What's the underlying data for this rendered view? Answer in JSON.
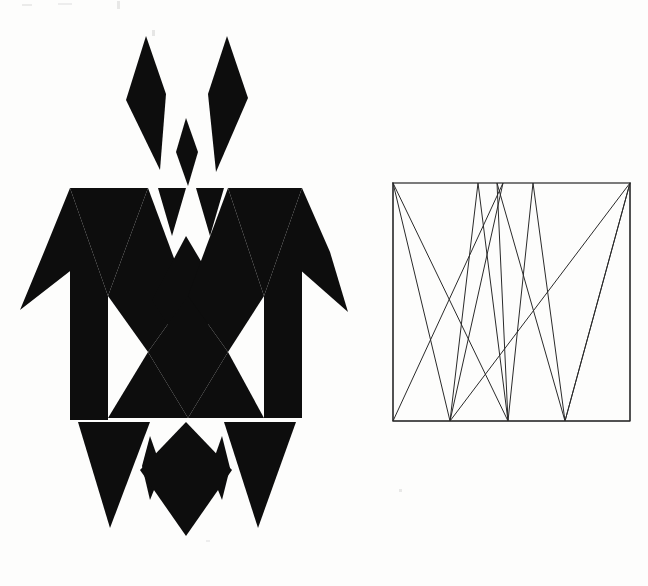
{
  "page": {
    "title": "Geometric turtle motif with companion zigzag line diagram",
    "background_color": "#fdfdfc",
    "ink_color": "#0d0d0d",
    "line_color": "#2a2a2a",
    "width": 648,
    "height": 586
  },
  "figures": [
    {
      "id": "turtle-motif",
      "name": "Geometric turtle motif",
      "description": "Solid black triangle-and-diamond composition forming a turtle seen from above",
      "bounds": {
        "x": 18,
        "y": 36,
        "width": 330,
        "height": 500
      },
      "parts": [
        {
          "name": "head-left-plume",
          "kind": "diamond"
        },
        {
          "name": "head-right-plume",
          "kind": "diamond"
        },
        {
          "name": "head-center-spike",
          "kind": "diamond"
        },
        {
          "name": "front-left-flipper",
          "kind": "triangle"
        },
        {
          "name": "front-right-flipper",
          "kind": "triangle"
        },
        {
          "name": "shell-zigzag-band-upper",
          "kind": "chevron-band"
        },
        {
          "name": "shell-zigzag-band-middle",
          "kind": "chevron-band"
        },
        {
          "name": "shell-zigzag-band-lower",
          "kind": "chevron-band"
        },
        {
          "name": "hind-left-leg",
          "kind": "triangle"
        },
        {
          "name": "hind-right-leg",
          "kind": "triangle"
        },
        {
          "name": "tail-diamond",
          "kind": "diamond"
        }
      ]
    },
    {
      "id": "zigzag-diagram",
      "name": "Square zigzag line diagram",
      "description": "Open square frame crossed by a continuous zigzag polyline running between top and bottom edges",
      "bounds": {
        "x": 393,
        "y": 183,
        "width": 237,
        "height": 238
      },
      "frame": {
        "left": 393,
        "top": 183,
        "right": 630,
        "bottom": 421
      }
    }
  ],
  "chart_data": {
    "type": "line",
    "xlabel": "",
    "ylabel": "",
    "xlim": [
      393,
      630
    ],
    "ylim": [
      183,
      421
    ],
    "grid": false,
    "legend": false,
    "frame": {
      "left": 393,
      "top": 183,
      "right": 630,
      "bottom": 421
    },
    "top_vertices_x": [
      393,
      478,
      497,
      503,
      533,
      630
    ],
    "bottom_vertices_x": [
      393,
      450,
      508,
      565,
      630
    ],
    "series": [
      {
        "name": "zigzag-path-a",
        "points": [
          [
            393,
            183
          ],
          [
            450,
            421
          ],
          [
            478,
            183
          ],
          [
            508,
            421
          ],
          [
            533,
            183
          ],
          [
            565,
            421
          ],
          [
            630,
            183
          ]
        ]
      },
      {
        "name": "zigzag-path-b",
        "points": [
          [
            393,
            183
          ],
          [
            508,
            421
          ],
          [
            497,
            183
          ],
          [
            565,
            421
          ],
          [
            630,
            183
          ]
        ]
      },
      {
        "name": "zigzag-path-c",
        "points": [
          [
            393,
            183
          ],
          [
            393,
            421
          ],
          [
            503,
            183
          ],
          [
            450,
            421
          ],
          [
            630,
            183
          ],
          [
            630,
            421
          ],
          [
            393,
            421
          ]
        ]
      }
    ]
  }
}
